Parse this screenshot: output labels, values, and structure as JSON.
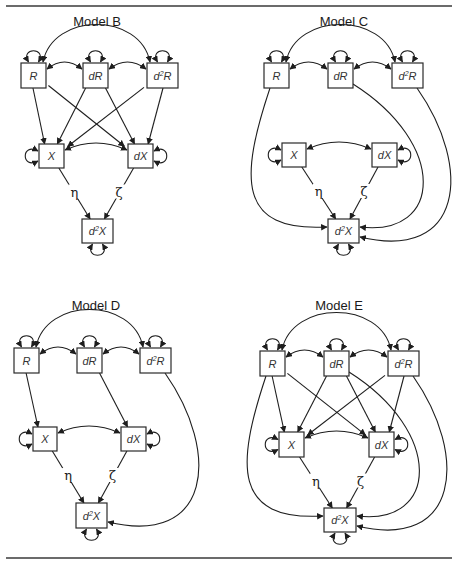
{
  "figure": {
    "width": 456,
    "height": 567,
    "rules": [
      {
        "name": "top-rule",
        "x1": 6,
        "x2": 452,
        "y": 6
      },
      {
        "name": "bottom-rule",
        "x1": 6,
        "x2": 452,
        "y": 558
      }
    ]
  },
  "node_labels": {
    "R": "R",
    "dR": "dR",
    "d2R": "d²R",
    "X": "X",
    "dX": "dX",
    "d2X": "d²X"
  },
  "path_labels": {
    "eta": "η",
    "zeta": "ζ"
  },
  "models": [
    {
      "id": "B",
      "title": "Model B",
      "title_pos": [
        97,
        26
      ],
      "nodes": {
        "R": {
          "x": 21,
          "y": 63,
          "w": 25,
          "h": 25
        },
        "dR": {
          "x": 83,
          "y": 63,
          "w": 25,
          "h": 25
        },
        "d2R": {
          "x": 147,
          "y": 63,
          "w": 31,
          "h": 25
        },
        "X": {
          "x": 39,
          "y": 144,
          "w": 25,
          "h": 24
        },
        "dX": {
          "x": 128,
          "y": 144,
          "w": 25,
          "h": 24
        },
        "d2X": {
          "x": 82,
          "y": 219,
          "w": 31,
          "h": 24
        }
      },
      "paths": [
        [
          "R",
          "X"
        ],
        [
          "R",
          "dX"
        ],
        [
          "dR",
          "X"
        ],
        [
          "dR",
          "dX"
        ],
        [
          "d2R",
          "X"
        ],
        [
          "d2R",
          "dX"
        ],
        [
          "X",
          "d2X",
          "eta"
        ],
        [
          "dX",
          "d2X",
          "zeta"
        ]
      ],
      "long_paths": []
    },
    {
      "id": "C",
      "title": "Model C",
      "title_pos": [
        344,
        26
      ],
      "nodes": {
        "R": {
          "x": 264,
          "y": 63,
          "w": 25,
          "h": 25
        },
        "dR": {
          "x": 328,
          "y": 63,
          "w": 25,
          "h": 25
        },
        "d2R": {
          "x": 392,
          "y": 63,
          "w": 31,
          "h": 25
        },
        "X": {
          "x": 282,
          "y": 143,
          "w": 24,
          "h": 24
        },
        "dX": {
          "x": 372,
          "y": 143,
          "w": 25,
          "h": 24
        },
        "d2X": {
          "x": 328,
          "y": 219,
          "w": 31,
          "h": 24
        }
      },
      "paths": [
        [
          "X",
          "d2X",
          "eta"
        ],
        [
          "dX",
          "d2X",
          "zeta"
        ]
      ],
      "long_paths": [
        "R",
        "dR",
        "d2R"
      ]
    },
    {
      "id": "D",
      "title": "Model D",
      "title_pos": [
        96,
        310
      ],
      "nodes": {
        "R": {
          "x": 14,
          "y": 348,
          "w": 25,
          "h": 25
        },
        "dR": {
          "x": 77,
          "y": 348,
          "w": 25,
          "h": 25
        },
        "d2R": {
          "x": 140,
          "y": 348,
          "w": 31,
          "h": 25
        },
        "X": {
          "x": 33,
          "y": 427,
          "w": 24,
          "h": 24
        },
        "dX": {
          "x": 121,
          "y": 427,
          "w": 25,
          "h": 24
        },
        "d2X": {
          "x": 76,
          "y": 503,
          "w": 31,
          "h": 25
        }
      },
      "paths": [
        [
          "R",
          "X"
        ],
        [
          "dR",
          "dX"
        ],
        [
          "X",
          "d2X",
          "eta"
        ],
        [
          "dX",
          "d2X",
          "zeta"
        ]
      ],
      "long_paths": [
        "d2R"
      ]
    },
    {
      "id": "E",
      "title": "Model E",
      "title_pos": [
        339,
        310
      ],
      "nodes": {
        "R": {
          "x": 260,
          "y": 351,
          "w": 25,
          "h": 25
        },
        "dR": {
          "x": 324,
          "y": 351,
          "w": 25,
          "h": 25
        },
        "d2R": {
          "x": 388,
          "y": 351,
          "w": 31,
          "h": 25
        },
        "X": {
          "x": 279,
          "y": 432,
          "w": 25,
          "h": 25
        },
        "dX": {
          "x": 369,
          "y": 432,
          "w": 25,
          "h": 25
        },
        "d2X": {
          "x": 324,
          "y": 508,
          "w": 32,
          "h": 24
        }
      },
      "paths": [
        [
          "R",
          "X"
        ],
        [
          "R",
          "dX"
        ],
        [
          "dR",
          "X"
        ],
        [
          "dR",
          "dX"
        ],
        [
          "d2R",
          "X"
        ],
        [
          "d2R",
          "dX"
        ],
        [
          "X",
          "d2X",
          "eta"
        ],
        [
          "dX",
          "d2X",
          "zeta"
        ]
      ],
      "long_paths": [
        "R",
        "dR",
        "d2R"
      ]
    }
  ]
}
